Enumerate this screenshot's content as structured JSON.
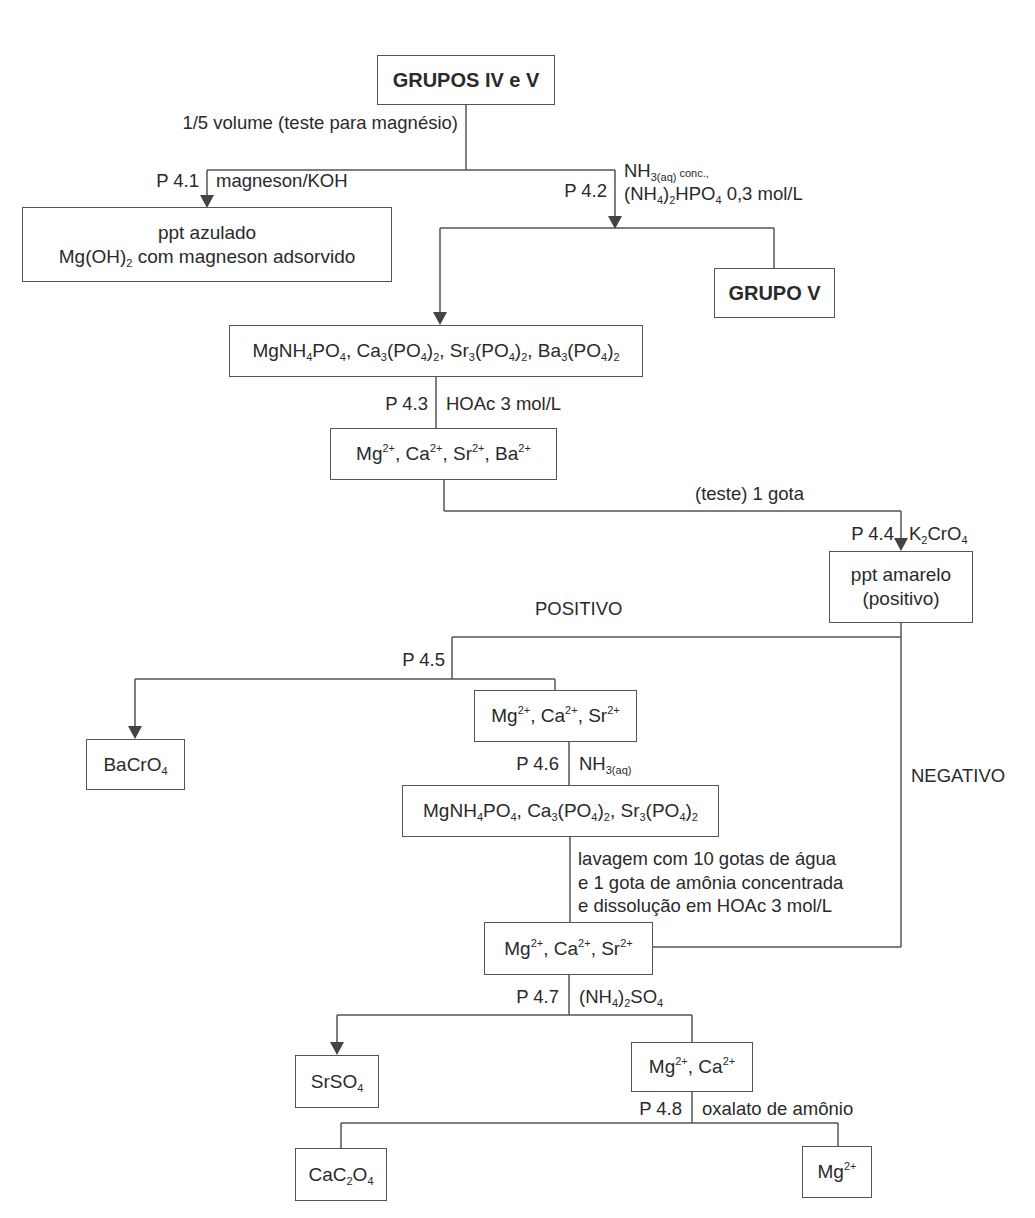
{
  "diagram": {
    "title": "GRUPOS IV e V",
    "nodes": {
      "start": "GRUPOS IV e V",
      "mg_test_result_line1": "ppt azulado",
      "mg_test_result_line2": "Mg(OH)2 com magneson adsorvido",
      "grupo_v": "GRUPO V",
      "phosphates_all": "MgNH4PO4, Ca3(PO4)2, Sr3(PO4)2, Ba3(PO4)2",
      "ions_all": "Mg2+, Ca2+, Sr2+, Ba2+",
      "yellow_ppt_line1": "ppt amarelo",
      "yellow_ppt_line2": "(positivo)",
      "bacro4": "BaCrO4",
      "ions_mg_ca_sr_1": "Mg2+, Ca2+, Sr2+",
      "phosphates_mg_ca_sr": "MgNH4PO4, Ca3(PO4)2, Sr3(PO4)2",
      "ions_mg_ca_sr_2": "Mg2+, Ca2+, Sr2+",
      "srso4": "SrSO4",
      "ions_mg_ca": "Mg2+, Ca2+",
      "cac2o4": "CaC2O4",
      "mg_final": "Mg2+"
    },
    "steps": {
      "split_label": "1/5 volume (teste para magnésio)",
      "p41": {
        "code": "P 4.1",
        "reagent": "magneson/KOH"
      },
      "p42": {
        "code": "P 4.2",
        "reagent_line1": "NH3(aq) conc.,",
        "reagent_line2": "(NH4)2HPO4 0,3 mol/L"
      },
      "p43": {
        "code": "P 4.3",
        "reagent": "HOAc 3 mol/L"
      },
      "test_drop": "(teste) 1 gota",
      "p44": {
        "code": "P 4.4",
        "reagent": "K2CrO4"
      },
      "positive": "POSITIVO",
      "negative": "NEGATIVO",
      "p45": {
        "code": "P 4.5"
      },
      "p46": {
        "code": "P 4.6",
        "reagent": "NH3(aq)"
      },
      "wash_line1": "lavagem com 10 gotas de água",
      "wash_line2": "e 1 gota de amônia concentrada",
      "wash_line3": "e dissolução em HOAc 3 mol/L",
      "p47": {
        "code": "P 4.7",
        "reagent": "(NH4)2SO4"
      },
      "p48": {
        "code": "P 4.8",
        "reagent": "oxalato de amônio"
      }
    },
    "colors": {
      "line": "#555555",
      "text": "#2a2a2a"
    }
  }
}
